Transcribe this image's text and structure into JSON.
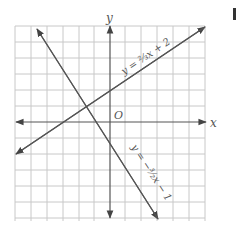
{
  "diagram": {
    "type": "coordinate-plane",
    "grid": {
      "x_min": -6,
      "x_max": 6,
      "y_min": -6,
      "y_max": 6,
      "origin_label": "O"
    },
    "axes": {
      "x_label": "x",
      "y_label": "y"
    },
    "lines": [
      {
        "equation": "y = 2/3x + 2",
        "label": "y = ⅔x + 2",
        "slope": 0.6667,
        "intercept": 2
      },
      {
        "equation": "y = -3/2x - 1",
        "label": "y = −³⁄₂x − 1",
        "slope": -1.5,
        "intercept": -1
      }
    ],
    "colors": {
      "grid": "#c8c8c8",
      "axis": "#555555",
      "line": "#555555"
    }
  }
}
